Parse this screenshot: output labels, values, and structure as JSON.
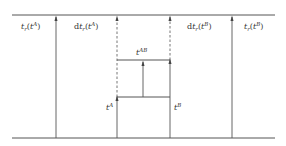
{
  "diagram": {
    "type": "timeline-transition",
    "colors": {
      "line": "#555555",
      "background": "#ffffff",
      "text": "#333333"
    },
    "labels": {
      "tr_A": {
        "prefix": "t",
        "sub": "r",
        "open": "(",
        "var": "t",
        "sup": "A",
        "close": ")"
      },
      "dtr_A": {
        "d": "d",
        "prefix": "t",
        "sub": "r",
        "open": "(",
        "var": "t",
        "sup": "A",
        "close": ")"
      },
      "dtr_B": {
        "d": "d",
        "prefix": "t",
        "sub": "r",
        "open": "(",
        "var": "t",
        "sup": "B",
        "close": ")"
      },
      "tr_B": {
        "prefix": "t",
        "sub": "r",
        "open": "(",
        "var": "t",
        "sup": "B",
        "close": ")"
      },
      "tAB": {
        "base": "t",
        "sup": "AB"
      },
      "tA": {
        "base": "t",
        "sup": "A"
      },
      "tB": {
        "base": "t",
        "sup": "B"
      }
    },
    "lines": {
      "top_baseline_y": 15,
      "bottom_baseline_y": 138,
      "verticals_x": [
        56,
        117,
        143,
        170,
        232
      ],
      "upper_horizontal_y": 60,
      "lower_horizontal_y": 97
    }
  }
}
